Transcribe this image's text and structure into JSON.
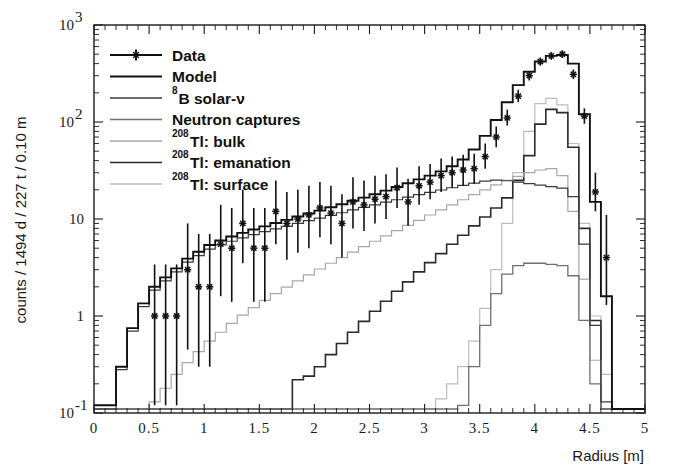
{
  "figure": {
    "background": "#ffffff",
    "frame_color": "#1a1a1a"
  },
  "axes": {
    "x_title": "Radius [m]",
    "y_title": "counts / 1494 d / 227 t / 0.10 m",
    "x_ticklabels": [
      "0",
      "0.5",
      "1",
      "1.5",
      "2",
      "2.5",
      "3",
      "3.5",
      "4",
      "4.5",
      "5"
    ],
    "y_ticklabels": [
      "10",
      "10",
      "10",
      "1",
      "10"
    ],
    "y_tick_exponents": [
      "3",
      "2",
      "",
      "",
      "-1"
    ],
    "y_tick_display": [
      "10^3",
      "10^2",
      "10",
      "1",
      "10^-1"
    ]
  },
  "legend": {
    "entries": [
      {
        "label": "Data",
        "style": "data",
        "color": "#111111"
      },
      {
        "label": "Model",
        "style": "line",
        "color": "#111111"
      },
      {
        "label": "B solar-ν",
        "sup": "8",
        "style": "line",
        "color": "#3a3a3a"
      },
      {
        "label": "Neutron captures",
        "style": "line",
        "color": "#707070"
      },
      {
        "label": "Tl: bulk",
        "sup": "208",
        "style": "line",
        "color": "#a8a8a8"
      },
      {
        "label": "Tl: emanation",
        "sup": "208",
        "style": "line",
        "color": "#2b2b2b"
      },
      {
        "label": "Tl: surface",
        "sup": "208",
        "style": "line",
        "color": "#bdbdbd"
      }
    ]
  },
  "chart_data": {
    "type": "line",
    "title": "",
    "xlabel": "Radius [m]",
    "ylabel": "counts / 1494 d / 227 t / 0.10 m",
    "xlim": [
      0,
      5
    ],
    "ylim": [
      0.1,
      1000
    ],
    "yscale": "log",
    "bin_width": 0.1,
    "grid": false,
    "legend_position": "top-left",
    "bin_edges": [
      0.0,
      0.1,
      0.2,
      0.3,
      0.4,
      0.5,
      0.6,
      0.7,
      0.8,
      0.9,
      1.0,
      1.1,
      1.2,
      1.3,
      1.4,
      1.5,
      1.6,
      1.7,
      1.8,
      1.9,
      2.0,
      2.1,
      2.2,
      2.3,
      2.4,
      2.5,
      2.6,
      2.7,
      2.8,
      2.9,
      3.0,
      3.1,
      3.2,
      3.3,
      3.4,
      3.5,
      3.6,
      3.7,
      3.8,
      3.9,
      4.0,
      4.1,
      4.2,
      4.3,
      4.4,
      4.5,
      4.6,
      4.7,
      4.8,
      4.9,
      5.0
    ],
    "series": [
      {
        "name": "Model",
        "color": "#111111",
        "width": 1.9,
        "values": [
          0.12,
          0.12,
          0.3,
          0.75,
          1.35,
          2.0,
          2.5,
          3.1,
          3.9,
          4.6,
          5.4,
          6.0,
          6.6,
          7.2,
          7.8,
          8.4,
          9.1,
          9.8,
          10.6,
          11.4,
          12.2,
          13.2,
          14.2,
          15.4,
          16.6,
          18.0,
          19.6,
          21.4,
          23.4,
          25.6,
          28.0,
          31.0,
          35.0,
          41.0,
          52.0,
          72.0,
          105.0,
          160.0,
          240.0,
          330.0,
          420.0,
          480.0,
          490.0,
          400.0,
          120.0,
          15.0,
          1.6,
          0.11,
          0.11,
          0.11
        ]
      },
      {
        "name": "B solar-nu",
        "color": "#3a3a3a",
        "width": 1.2,
        "values": [
          0.11,
          0.11,
          0.28,
          0.7,
          1.25,
          1.85,
          2.3,
          2.85,
          3.6,
          4.2,
          4.9,
          5.4,
          5.9,
          6.4,
          6.9,
          7.4,
          7.9,
          8.4,
          9.0,
          9.6,
          10.2,
          10.9,
          11.6,
          12.4,
          13.2,
          14.0,
          14.9,
          15.8,
          16.8,
          17.8,
          18.8,
          19.9,
          21.0,
          22.2,
          23.4,
          24.6,
          25.2,
          24.8,
          24.0,
          23.2,
          22.4,
          21.6,
          20.8,
          17.0,
          5.5,
          0.8,
          0.13,
          0.11,
          0.11,
          0.11
        ]
      },
      {
        "name": "Neutron captures",
        "color": "#707070",
        "width": 1.3,
        "values": [
          0.11,
          0.11,
          0.11,
          0.11,
          0.11,
          0.11,
          0.11,
          0.11,
          0.11,
          0.11,
          0.11,
          0.11,
          0.11,
          0.11,
          0.11,
          0.11,
          0.11,
          0.11,
          0.11,
          0.11,
          0.11,
          0.11,
          0.11,
          0.11,
          0.11,
          0.11,
          0.11,
          0.11,
          0.11,
          0.11,
          0.11,
          0.11,
          0.11,
          0.12,
          0.3,
          0.8,
          1.7,
          2.7,
          3.3,
          3.5,
          3.5,
          3.4,
          3.3,
          2.6,
          0.9,
          0.2,
          0.11,
          0.11,
          0.11,
          0.11
        ]
      },
      {
        "name": "Tl: bulk",
        "color": "#a8a8a8",
        "width": 1.2,
        "values": [
          0.11,
          0.11,
          0.11,
          0.11,
          0.11,
          0.13,
          0.18,
          0.25,
          0.33,
          0.43,
          0.55,
          0.68,
          0.84,
          1.02,
          1.22,
          1.45,
          1.7,
          1.98,
          2.3,
          2.65,
          3.05,
          3.5,
          4.0,
          4.55,
          5.2,
          5.9,
          6.7,
          7.6,
          8.6,
          9.7,
          11.0,
          12.4,
          14.0,
          15.8,
          17.8,
          20.0,
          22.5,
          25.0,
          27.5,
          30.0,
          32.0,
          33.0,
          28.0,
          12.0,
          2.4,
          0.35,
          0.11,
          0.11,
          0.11,
          0.11
        ]
      },
      {
        "name": "Tl: emanation",
        "color": "#2b2b2b",
        "width": 1.6,
        "values": [
          0.11,
          0.11,
          0.11,
          0.11,
          0.11,
          0.11,
          0.11,
          0.11,
          0.11,
          0.11,
          0.11,
          0.11,
          0.11,
          0.11,
          0.11,
          0.11,
          0.11,
          0.11,
          0.22,
          0.24,
          0.3,
          0.4,
          0.52,
          0.68,
          0.88,
          1.12,
          1.42,
          1.8,
          2.25,
          2.85,
          3.55,
          4.4,
          5.5,
          6.8,
          8.5,
          10.5,
          13.0,
          16.5,
          25.0,
          45.0,
          95.0,
          135.0,
          125.0,
          55.0,
          8.0,
          0.9,
          0.11,
          0.11,
          0.11,
          0.11
        ]
      },
      {
        "name": "Tl: surface",
        "color": "#bdbdbd",
        "width": 1.2,
        "values": [
          0.11,
          0.11,
          0.11,
          0.11,
          0.11,
          0.11,
          0.11,
          0.11,
          0.11,
          0.11,
          0.11,
          0.11,
          0.11,
          0.11,
          0.11,
          0.11,
          0.11,
          0.11,
          0.11,
          0.11,
          0.11,
          0.11,
          0.11,
          0.11,
          0.11,
          0.11,
          0.11,
          0.11,
          0.11,
          0.11,
          0.11,
          0.14,
          0.2,
          0.3,
          0.55,
          1.2,
          3.0,
          9.0,
          30.0,
          80.0,
          155.0,
          175.0,
          150.0,
          60.0,
          9.0,
          1.0,
          0.25,
          0.11,
          0.11,
          0.11
        ]
      }
    ],
    "data_points": [
      {
        "x": 0.55,
        "y": 1.0,
        "lo": 0.12,
        "hi": 3.4
      },
      {
        "x": 0.65,
        "y": 1.0,
        "lo": 0.12,
        "hi": 3.4
      },
      {
        "x": 0.75,
        "y": 1.0,
        "lo": 0.12,
        "hi": 3.4
      },
      {
        "x": 0.85,
        "y": 3.0,
        "lo": 0.45,
        "hi": 9.0
      },
      {
        "x": 0.95,
        "y": 2.0,
        "lo": 0.3,
        "hi": 7.0
      },
      {
        "x": 1.05,
        "y": 2.0,
        "lo": 0.3,
        "hi": 7.0
      },
      {
        "x": 1.15,
        "y": 5.5,
        "lo": 1.6,
        "hi": 14.0
      },
      {
        "x": 1.25,
        "y": 5.0,
        "lo": 1.4,
        "hi": 13.0
      },
      {
        "x": 1.35,
        "y": 9.0,
        "lo": 3.5,
        "hi": 20.0
      },
      {
        "x": 1.45,
        "y": 5.0,
        "lo": 1.4,
        "hi": 13.0
      },
      {
        "x": 1.55,
        "y": 5.0,
        "lo": 1.4,
        "hi": 13.0
      },
      {
        "x": 1.65,
        "y": 12.0,
        "lo": 5.5,
        "hi": 25.0
      },
      {
        "x": 1.75,
        "y": 9.0,
        "lo": 3.8,
        "hi": 19.0
      },
      {
        "x": 1.85,
        "y": 10.0,
        "lo": 4.5,
        "hi": 20.0
      },
      {
        "x": 1.95,
        "y": 11.0,
        "lo": 5.0,
        "hi": 22.0
      },
      {
        "x": 2.05,
        "y": 13.0,
        "lo": 6.5,
        "hi": 24.0
      },
      {
        "x": 2.15,
        "y": 11.5,
        "lo": 5.5,
        "hi": 22.0
      },
      {
        "x": 2.25,
        "y": 9.0,
        "lo": 4.0,
        "hi": 18.0
      },
      {
        "x": 2.35,
        "y": 15.0,
        "lo": 8.0,
        "hi": 27.0
      },
      {
        "x": 2.45,
        "y": 14.0,
        "lo": 7.5,
        "hi": 25.0
      },
      {
        "x": 2.55,
        "y": 16.0,
        "lo": 9.0,
        "hi": 28.0
      },
      {
        "x": 2.65,
        "y": 17.0,
        "lo": 10.0,
        "hi": 29.0
      },
      {
        "x": 2.75,
        "y": 21.0,
        "lo": 13.0,
        "hi": 34.0
      },
      {
        "x": 2.85,
        "y": 15.0,
        "lo": 8.5,
        "hi": 26.0
      },
      {
        "x": 2.95,
        "y": 22.0,
        "lo": 14.0,
        "hi": 35.0
      },
      {
        "x": 3.05,
        "y": 24.0,
        "lo": 16.0,
        "hi": 37.0
      },
      {
        "x": 3.15,
        "y": 28.0,
        "lo": 19.0,
        "hi": 42.0
      },
      {
        "x": 3.25,
        "y": 30.0,
        "lo": 21.0,
        "hi": 44.0
      },
      {
        "x": 3.35,
        "y": 32.0,
        "lo": 22.0,
        "hi": 46.0
      },
      {
        "x": 3.45,
        "y": 33.0,
        "lo": 23.0,
        "hi": 47.0
      },
      {
        "x": 3.55,
        "y": 44.0,
        "lo": 33.0,
        "hi": 60.0
      },
      {
        "x": 3.65,
        "y": 70.0,
        "lo": 55.0,
        "hi": 90.0
      },
      {
        "x": 3.75,
        "y": 110.0,
        "lo": 92.0,
        "hi": 134.0
      },
      {
        "x": 3.85,
        "y": 185.0,
        "lo": 160.0,
        "hi": 215.0
      },
      {
        "x": 3.95,
        "y": 300.0,
        "lo": 268.0,
        "hi": 336.0
      },
      {
        "x": 4.05,
        "y": 420.0,
        "lo": 382.0,
        "hi": 462.0
      },
      {
        "x": 4.15,
        "y": 480.0,
        "lo": 440.0,
        "hi": 524.0
      },
      {
        "x": 4.25,
        "y": 500.0,
        "lo": 458.0,
        "hi": 546.0
      },
      {
        "x": 4.35,
        "y": 310.0,
        "lo": 277.0,
        "hi": 348.0
      },
      {
        "x": 4.45,
        "y": 115.0,
        "lo": 96.0,
        "hi": 138.0
      },
      {
        "x": 4.55,
        "y": 19.0,
        "lo": 12.0,
        "hi": 30.0
      },
      {
        "x": 4.65,
        "y": 4.0,
        "lo": 1.3,
        "hi": 11.0
      }
    ]
  }
}
